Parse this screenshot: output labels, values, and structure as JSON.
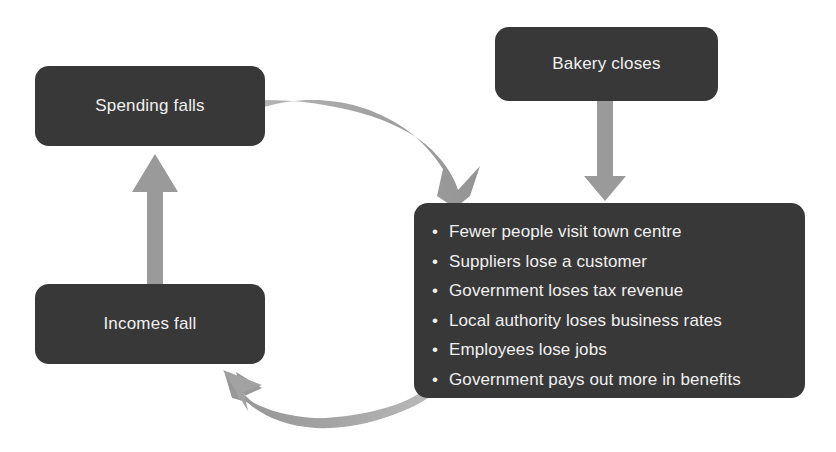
{
  "diagram": {
    "background_color": "#ffffff",
    "node_color": "#383838",
    "text_color": "#f0f0f0",
    "arrow_color": "#9a9a9a"
  },
  "nodes": {
    "bakery": {
      "label": "Bakery closes"
    },
    "spending": {
      "label": "Spending falls"
    },
    "incomes": {
      "label": "Incomes fall"
    },
    "effects": {
      "bullets": [
        "Fewer people visit town centre",
        "Suppliers lose a customer",
        "Government loses tax revenue",
        "Local authority loses business rates",
        "Employees lose jobs",
        "Government pays out more in benefits"
      ]
    }
  },
  "connectors": [
    {
      "name": "bakery-to-effects",
      "kind": "straight-down-arrow",
      "from": "bakery",
      "to": "effects"
    },
    {
      "name": "spending-to-effects",
      "kind": "curved-arrow",
      "from": "spending",
      "to": "effects"
    },
    {
      "name": "effects-to-incomes",
      "kind": "curved-arrow",
      "from": "effects",
      "to": "incomes"
    },
    {
      "name": "incomes-to-spending",
      "kind": "straight-up-arrow",
      "from": "incomes",
      "to": "spending"
    }
  ]
}
